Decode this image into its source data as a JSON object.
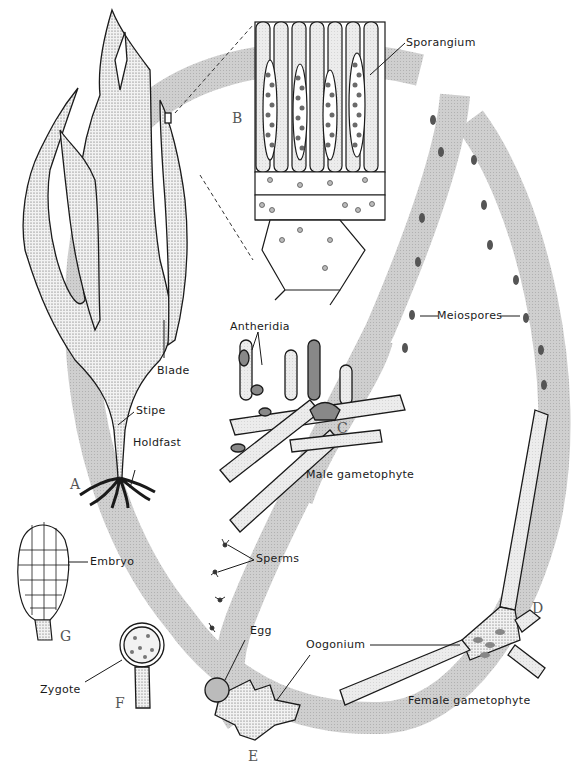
{
  "diagram": {
    "colors": {
      "cycle_band": "#c9c9c9",
      "stipple": "#8a8a8a",
      "outline": "#1a1a1a",
      "dark_cell": "#6a6a6a",
      "background": "#ffffff"
    },
    "stage_letters": [
      "A",
      "B",
      "C",
      "D",
      "E",
      "F",
      "G"
    ],
    "labels": {
      "sporangium": "Sporangium",
      "blade": "Blade",
      "stipe": "Stipe",
      "holdfast": "Holdfast",
      "meiospores": "Meiospores",
      "antheridia": "Antheridia",
      "male_gametophyte": "Male gametophyte",
      "sperms": "Sperms",
      "embryo": "Embryo",
      "egg": "Egg",
      "oogonium": "Oogonium",
      "zygote": "Zygote",
      "female_gametophyte": "Female gametophyte"
    }
  }
}
